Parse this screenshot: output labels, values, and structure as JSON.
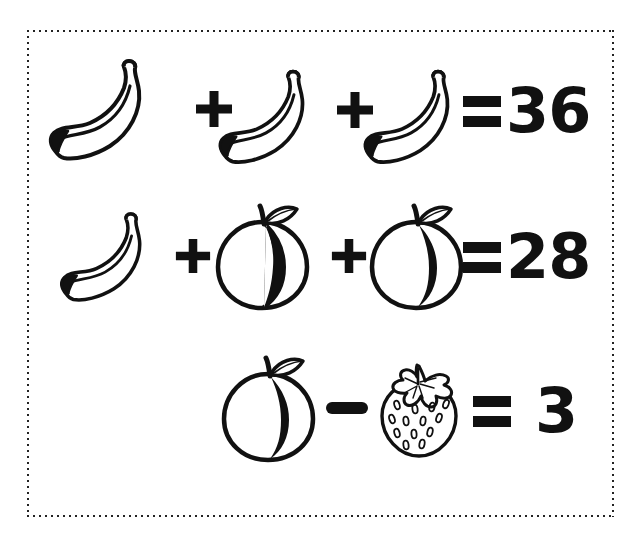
{
  "puzzle": {
    "title": "fruit-algebra-puzzle",
    "background_color": "#ffffff",
    "ink_color": "#111111",
    "border_style": "dotted",
    "rows": [
      {
        "id": "row-1",
        "terms": [
          "banana",
          "banana",
          "banana"
        ],
        "operators": [
          "+",
          "+"
        ],
        "equals": "=",
        "result": "36"
      },
      {
        "id": "row-2",
        "terms": [
          "banana",
          "peach",
          "peach"
        ],
        "operators": [
          "+",
          "+"
        ],
        "equals": "=",
        "result": "28"
      },
      {
        "id": "row-3",
        "terms": [
          "peach",
          "strawberry"
        ],
        "operators": [
          "–"
        ],
        "equals": "=",
        "result": "3"
      }
    ],
    "icons": {
      "banana": "banana-icon",
      "peach": "peach-icon",
      "strawberry": "strawberry-icon",
      "plus": "plus-sign",
      "minus": "minus-sign",
      "equals": "equals-sign"
    }
  }
}
